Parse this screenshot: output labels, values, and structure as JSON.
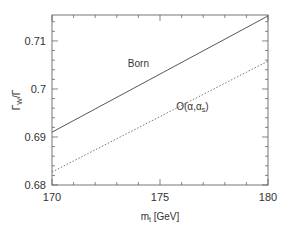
{
  "chart_data": {
    "type": "line",
    "title": "",
    "xlabel": "m_t [GeV]",
    "xlabel_main": "m",
    "xlabel_sub": "t",
    "xlabel_unit": " [GeV]",
    "ylabel": "Γ_W/Γ",
    "ylabel_main": "Γ",
    "ylabel_sub": "W",
    "ylabel_tail": "/Γ",
    "xlim": [
      170,
      180
    ],
    "ylim": [
      0.68,
      0.7154
    ],
    "xticks": [
      170,
      175,
      180
    ],
    "xtick_labels": [
      "170",
      "175",
      "180"
    ],
    "yticks": [
      0.68,
      0.69,
      0.7,
      0.71
    ],
    "ytick_labels": [
      "0.68",
      "0.69",
      "0.7",
      "0.71"
    ],
    "grid": false,
    "series": [
      {
        "name": "Born",
        "style": "solid",
        "x": [
          170,
          180
        ],
        "y": [
          0.691,
          0.7152
        ]
      },
      {
        "name": "O(α,α_s)",
        "style": "dotted",
        "x": [
          170,
          180
        ],
        "y": [
          0.6827,
          0.7058
        ]
      }
    ],
    "annotations": [
      {
        "text": "Born",
        "x": 174.0,
        "y": 0.7045
      },
      {
        "text": "O(α,α",
        "sub": "s",
        "tail": ")",
        "x": 176.5,
        "y": 0.6957
      }
    ]
  }
}
